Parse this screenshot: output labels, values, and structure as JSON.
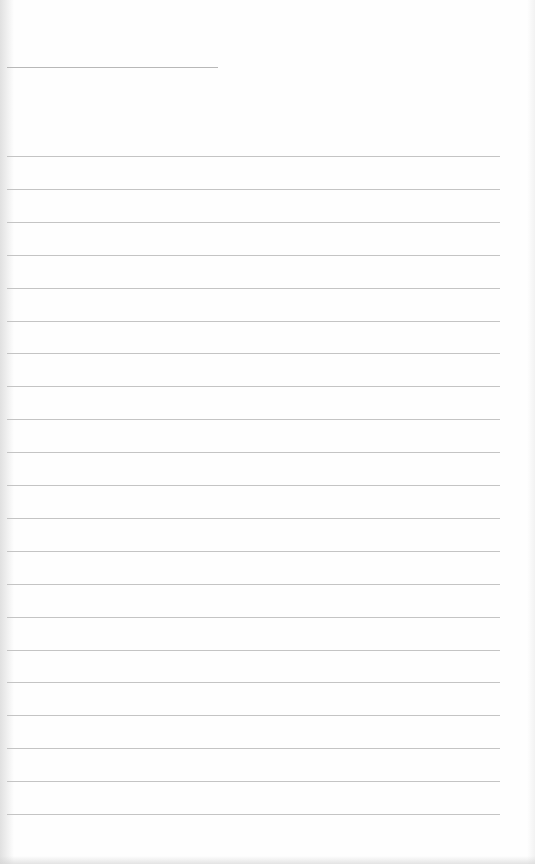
{
  "document": {
    "type": "blank-lined-sheet",
    "title_line": {
      "x": 7,
      "y": 67,
      "width": 211
    },
    "ruled_lines": {
      "count": 21,
      "first_y": 156,
      "spacing": 32.9,
      "x": 7,
      "width": 493
    },
    "colors": {
      "paper": "#fefefe",
      "title_line": "#b8b8b8",
      "rule": "#c4c4c4"
    },
    "text_content": []
  }
}
